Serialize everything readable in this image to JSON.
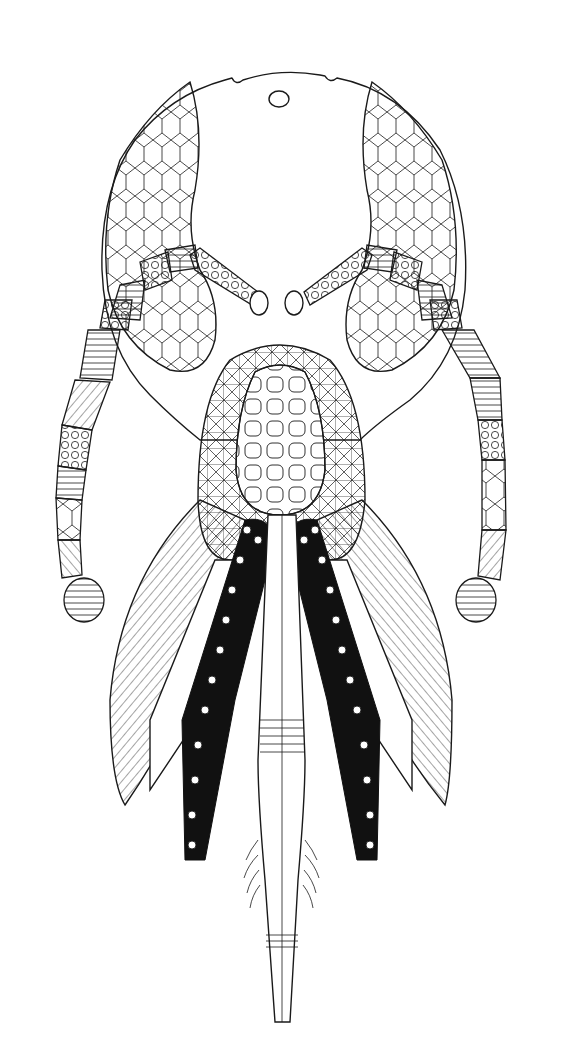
{
  "figure": {
    "background_color": "#ffffff",
    "ink_color": "#1a1a1a",
    "parts": {
      "head_capsule": {
        "label": "head capsule"
      },
      "compound_eye_left": {
        "label": "compound eye (left)"
      },
      "compound_eye_right": {
        "label": "compound eye (right)"
      },
      "ocellus": {
        "label": "ocellus"
      },
      "antenna_left": {
        "label": "antenna (left)"
      },
      "antenna_right": {
        "label": "antenna (right)"
      },
      "clypeus": {
        "label": "clypeus / labrum"
      },
      "maxilla_left": {
        "label": "maxilla (left)"
      },
      "maxilla_right": {
        "label": "maxilla (right)"
      },
      "labial_palp_left": {
        "label": "labial palp (left)"
      },
      "labial_palp_right": {
        "label": "labial palp (right)"
      },
      "glossa": {
        "label": "glossa / tongue"
      }
    }
  }
}
